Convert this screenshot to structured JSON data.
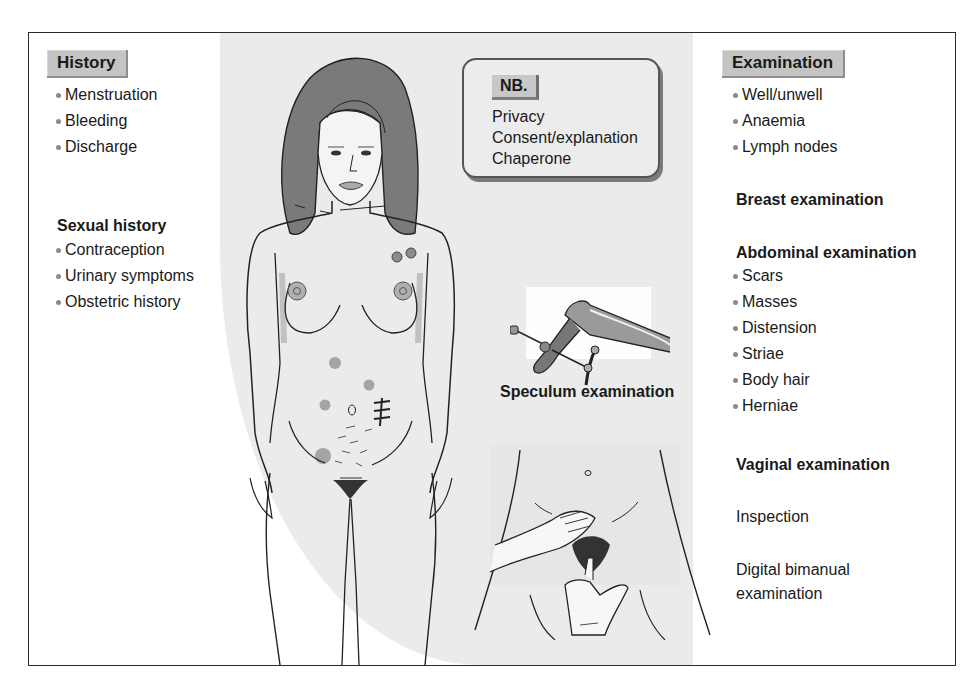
{
  "history": {
    "title": "History",
    "items": [
      "Menstruation",
      "Bleeding",
      "Discharge"
    ]
  },
  "sexual_history": {
    "title": "Sexual history",
    "items": [
      "Contraception",
      "Urinary symptoms",
      "Obstetric history"
    ]
  },
  "nb": {
    "title": "NB.",
    "lines": [
      "Privacy",
      "Consent/explanation",
      "Chaperone"
    ]
  },
  "speculum": {
    "label": "Speculum examination"
  },
  "examination": {
    "title": "Examination",
    "items": [
      "Well/unwell",
      "Anaemia",
      "Lymph nodes"
    ]
  },
  "breast_examination": {
    "title": "Breast examination"
  },
  "abdominal_examination": {
    "title": "Abdominal examination",
    "items": [
      "Scars",
      "Masses",
      "Distension",
      "Striae",
      "Body hair",
      "Herniae"
    ]
  },
  "vaginal_examination": {
    "title": "Vaginal examination",
    "inspection": "Inspection",
    "bimanual_line1": "Digital bimanual",
    "bimanual_line2": "examination"
  },
  "colors": {
    "tab_fill": "#c4c4c4",
    "panel_gray": "#ebebeb",
    "hair": "#7a7a7a",
    "lump": "#8c8c8c",
    "bullet": "#8a8a8a",
    "outline": "#2a2a2a"
  }
}
